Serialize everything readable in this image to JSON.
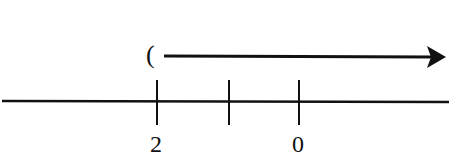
{
  "diagram": {
    "type": "number-line-inequality",
    "number_line": {
      "ticks": [
        {
          "x": 156,
          "label": "2"
        },
        {
          "x": 230,
          "label": ""
        },
        {
          "x": 298,
          "label": "0"
        }
      ]
    },
    "solution_ray": {
      "endpoint_symbol": "(",
      "endpoint_x": 156,
      "direction": "right",
      "open_endpoint": true
    },
    "colors": {
      "ink": "#111111",
      "background": "#ffffff"
    }
  }
}
